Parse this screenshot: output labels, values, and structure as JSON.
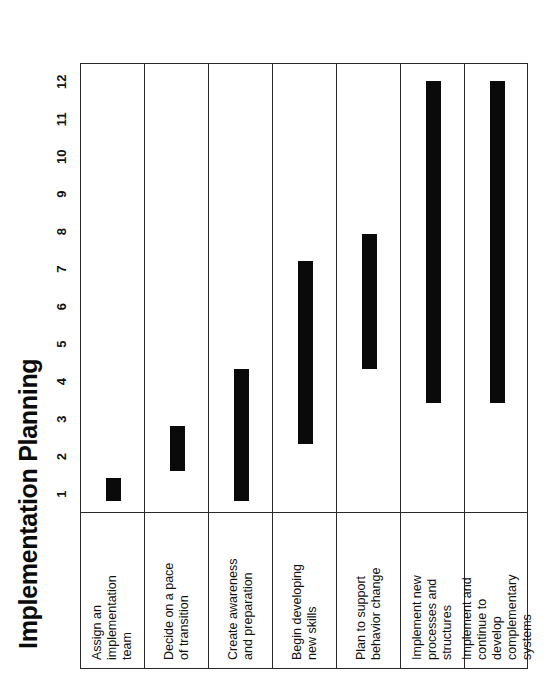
{
  "chart_data": {
    "type": "bar",
    "subtype": "gantt",
    "title": "Implementation Planning",
    "xlabel": "",
    "ylabel": "",
    "xlim": [
      0.5,
      12.5
    ],
    "xticks": [
      1,
      2,
      3,
      4,
      5,
      6,
      7,
      8,
      9,
      10,
      11,
      12
    ],
    "grid": false,
    "legend": "none",
    "orientation": "rotated-90-ccw",
    "bar_color": "#0a0a0a",
    "frame_color": "#2a2a2a",
    "background": "#ffffff",
    "categories": [
      "Assign an implementation team",
      "Decide on a pace of transition",
      "Create awareness and preparation",
      "Begin developing new skills",
      "Plan to support behavior change",
      "Implement new processes and structures",
      "Implement and continue to develop complementary systems"
    ],
    "tasks": [
      {
        "label": "Assign an\nimplementation\nteam",
        "start": 0.8,
        "end": 1.4,
        "duration": 0.6
      },
      {
        "label": "Decide on a pace\nof transition",
        "start": 1.6,
        "end": 2.8,
        "duration": 1.2
      },
      {
        "label": "Create awareness\nand preparation",
        "start": 0.8,
        "end": 4.3,
        "duration": 3.5
      },
      {
        "label": "Begin developing\nnew skills",
        "start": 2.3,
        "end": 7.2,
        "duration": 4.9
      },
      {
        "label": "Plan to support\nbehavior change",
        "start": 4.3,
        "end": 7.9,
        "duration": 3.6
      },
      {
        "label": "Implement new\nprocesses and\nstructures",
        "start": 3.4,
        "end": 12.0,
        "duration": 8.6
      },
      {
        "label": "Implement and\ncontinue to\ndevelop\ncomplementary\nsystems",
        "start": 3.4,
        "end": 12.0,
        "duration": 8.6
      }
    ]
  }
}
